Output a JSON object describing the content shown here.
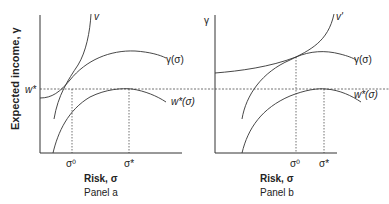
{
  "figure": {
    "y_axis_label": "Expected income, γ",
    "panel_a": {
      "caption": "Panel a",
      "x_axis_label": "Risk, σ",
      "x_ticks": [
        "σ⁰",
        "σ*"
      ],
      "y_ticks": [
        "w*"
      ],
      "curves": {
        "indifference": "v",
        "expected_income": "γ(σ)",
        "wage": "w*(σ)"
      }
    },
    "panel_b": {
      "caption": "Panel b",
      "x_axis_label": "Risk, σ",
      "y_axis_label": "γ",
      "x_ticks": [
        "σ⁰",
        "σ*"
      ],
      "curves": {
        "indifference": "v'",
        "expected_income": "γ(σ)",
        "wage": "w*(σ)"
      }
    }
  }
}
